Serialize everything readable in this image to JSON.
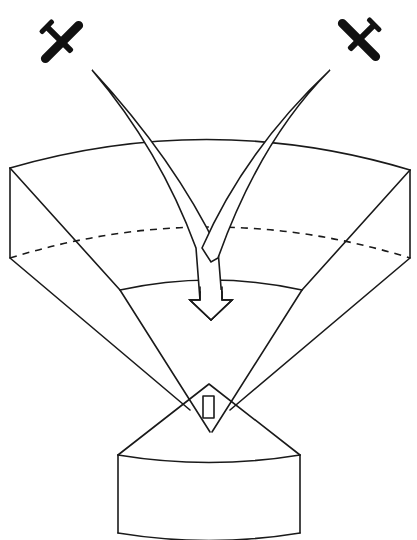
{
  "diagram": {
    "type": "radar-coverage-illustration",
    "elements": {
      "aircraft": [
        {
          "id": "aircraft-left",
          "icon": "airplane-icon",
          "position": "top-left"
        },
        {
          "id": "aircraft-right",
          "icon": "airplane-icon",
          "position": "top-right"
        }
      ],
      "arrows": [
        {
          "id": "arrow-from-left-aircraft",
          "direction": "down-converging"
        },
        {
          "id": "arrow-from-right-aircraft",
          "direction": "down-converging"
        }
      ],
      "beam_sector": {
        "upper_boundary": "solid-arc",
        "middle_boundary": "dashed-arc",
        "inner_boundary": "solid-arc"
      },
      "sensor": {
        "shape": "diamond-with-rectangle"
      },
      "base_block": {
        "shape": "curved-block"
      }
    },
    "colors": {
      "line": "#1a1a1a",
      "background": "#ffffff",
      "aircraft": "#111111"
    }
  }
}
